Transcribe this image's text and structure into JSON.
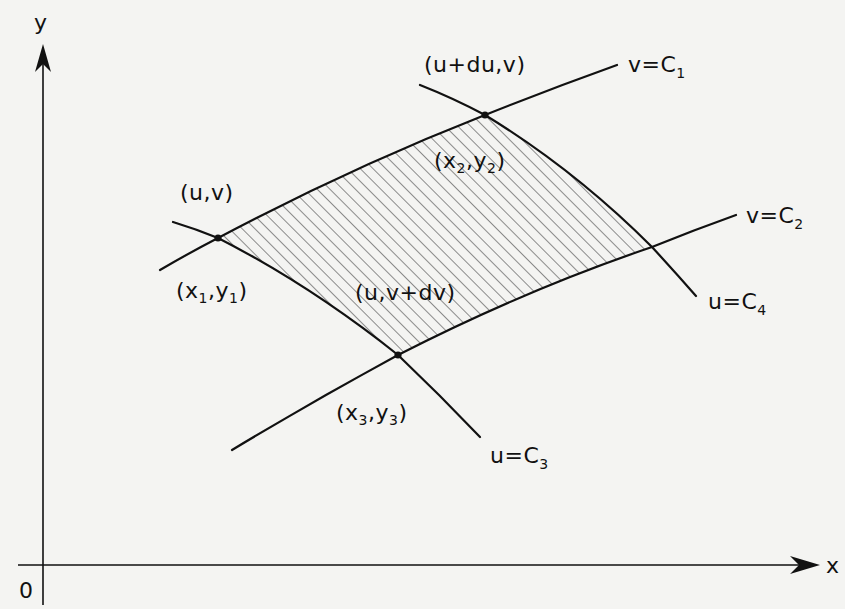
{
  "figure": {
    "type": "curvilinear-coordinate-element",
    "axes": {
      "x_label": "x",
      "y_label": "y",
      "origin_label": "0"
    },
    "curves": [
      {
        "id": "v_c1",
        "label": "v=C",
        "subscript": "1",
        "family": "v-curve"
      },
      {
        "id": "v_c2",
        "label": "v=C",
        "subscript": "2",
        "family": "v-curve"
      },
      {
        "id": "u_c3",
        "label": "u=C",
        "subscript": "3",
        "family": "u-curve"
      },
      {
        "id": "u_c4",
        "label": "u=C",
        "subscript": "4",
        "family": "u-curve"
      }
    ],
    "points": [
      {
        "id": "p1",
        "uv_label": "(u,v)",
        "xy_label": {
          "open": "(x",
          "sub_x": "1",
          "mid": ",y",
          "sub_y": "1",
          "close": ")"
        }
      },
      {
        "id": "p2",
        "uv_label": "(u+du,v)",
        "xy_label": {
          "open": "(x",
          "sub_x": "2",
          "mid": ",y",
          "sub_y": "2",
          "close": ")"
        }
      },
      {
        "id": "p3",
        "uv_label": "(u,v+dv)",
        "xy_label": {
          "open": "(x",
          "sub_x": "3",
          "mid": ",y",
          "sub_y": "3",
          "close": ")"
        }
      }
    ],
    "shaded_region": {
      "description": "hatched area element bounded by v=C1, v=C2, u=C3, u=C4",
      "pattern": "diagonal-hatch"
    },
    "colors": {
      "ink": "#111111",
      "paper": "#f4f4f2",
      "hatch": "#333333"
    }
  }
}
